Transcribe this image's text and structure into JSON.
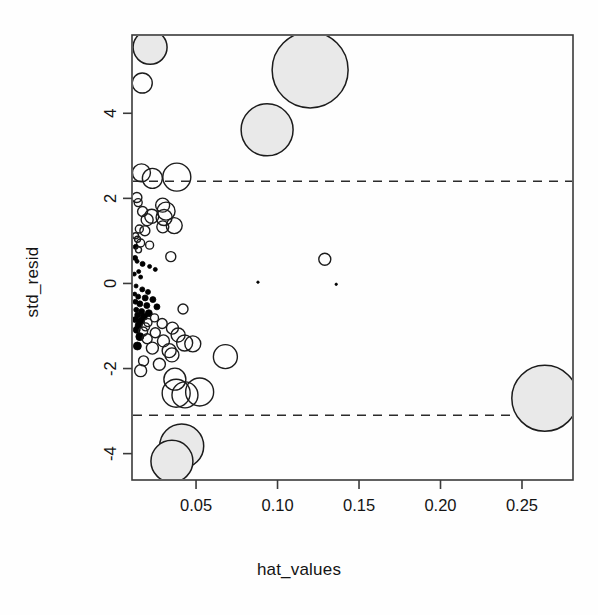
{
  "chart_data": {
    "type": "scatter",
    "title": "",
    "subtitle": "",
    "xlabel": "hat_values",
    "ylabel": "std_resid",
    "xlim": [
      0.0107,
      0.2813
    ],
    "ylim": [
      -4.62,
      5.84
    ],
    "grid": false,
    "legend": "none",
    "xticks": [
      0.05,
      0.1,
      0.15,
      0.2,
      0.25
    ],
    "xtick_labels": [
      "0.05",
      "0.10",
      "0.15",
      "0.20",
      "0.25"
    ],
    "yticks": [
      4,
      2,
      0,
      -2,
      -4
    ],
    "ytick_labels": [
      "4",
      "2",
      "0",
      "-2",
      "-4"
    ],
    "reference_lines": [
      {
        "name": "upper-threshold",
        "axis": "y",
        "value": 2.4,
        "style": "dashed"
      },
      {
        "name": "lower-threshold",
        "axis": "y",
        "value": -3.1,
        "style": "dashed"
      }
    ],
    "marker_style": {
      "shape": "circle",
      "size_encodes": "cooks_distance",
      "small_fill": "#000000",
      "outline": "#1c1c1c",
      "large_fill": "#e9e9e9"
    },
    "points": [
      {
        "x": 0.0218,
        "y": 5.55,
        "r": 17,
        "filled": true
      },
      {
        "x": 0.017,
        "y": 4.71,
        "r": 10,
        "filled": false
      },
      {
        "x": 0.12,
        "y": 5.02,
        "r": 38,
        "filled": true
      },
      {
        "x": 0.0936,
        "y": 3.61,
        "r": 26,
        "filled": true
      },
      {
        "x": 0.0165,
        "y": 2.6,
        "r": 9,
        "filled": false
      },
      {
        "x": 0.0232,
        "y": 2.47,
        "r": 10,
        "filled": false
      },
      {
        "x": 0.0382,
        "y": 2.5,
        "r": 14,
        "filled": false
      },
      {
        "x": 0.0137,
        "y": 2.02,
        "r": 5,
        "filled": false
      },
      {
        "x": 0.0145,
        "y": 1.9,
        "r": 4,
        "filled": false
      },
      {
        "x": 0.0295,
        "y": 1.84,
        "r": 7,
        "filled": false
      },
      {
        "x": 0.0316,
        "y": 1.7,
        "r": 9,
        "filled": false
      },
      {
        "x": 0.0172,
        "y": 1.69,
        "r": 5,
        "filled": false
      },
      {
        "x": 0.0228,
        "y": 1.58,
        "r": 7,
        "filled": false
      },
      {
        "x": 0.0304,
        "y": 1.55,
        "r": 8,
        "filled": false
      },
      {
        "x": 0.02,
        "y": 1.5,
        "r": 6,
        "filled": false
      },
      {
        "x": 0.0366,
        "y": 1.36,
        "r": 8,
        "filled": false
      },
      {
        "x": 0.0296,
        "y": 1.33,
        "r": 6,
        "filled": false
      },
      {
        "x": 0.0152,
        "y": 1.28,
        "r": 4,
        "filled": false
      },
      {
        "x": 0.0186,
        "y": 1.24,
        "r": 5,
        "filled": false
      },
      {
        "x": 0.0129,
        "y": 1.12,
        "r": 3,
        "filled": false
      },
      {
        "x": 0.0141,
        "y": 1.04,
        "r": 3,
        "filled": false
      },
      {
        "x": 0.016,
        "y": 0.95,
        "r": 4,
        "filled": false
      },
      {
        "x": 0.0215,
        "y": 0.9,
        "r": 4,
        "filled": false
      },
      {
        "x": 0.013,
        "y": 0.86,
        "r": 2.5,
        "filled": true
      },
      {
        "x": 0.0147,
        "y": 0.79,
        "r": 3,
        "filled": false
      },
      {
        "x": 0.0345,
        "y": 0.63,
        "r": 5,
        "filled": false
      },
      {
        "x": 0.129,
        "y": 0.57,
        "r": 6,
        "filled": false
      },
      {
        "x": 0.0126,
        "y": 0.6,
        "r": 2.5,
        "filled": true
      },
      {
        "x": 0.0138,
        "y": 0.52,
        "r": 2,
        "filled": true
      },
      {
        "x": 0.0172,
        "y": 0.46,
        "r": 2.5,
        "filled": true
      },
      {
        "x": 0.0215,
        "y": 0.4,
        "r": 2,
        "filled": true
      },
      {
        "x": 0.025,
        "y": 0.33,
        "r": 2,
        "filled": true
      },
      {
        "x": 0.0148,
        "y": 0.28,
        "r": 2,
        "filled": true
      },
      {
        "x": 0.0121,
        "y": 0.22,
        "r": 2,
        "filled": true
      },
      {
        "x": 0.016,
        "y": 0.15,
        "r": 2,
        "filled": true
      },
      {
        "x": 0.088,
        "y": 0.03,
        "r": 1.2,
        "filled": true
      },
      {
        "x": 0.136,
        "y": -0.02,
        "r": 1.2,
        "filled": true
      },
      {
        "x": 0.0132,
        "y": -0.06,
        "r": 2,
        "filled": true
      },
      {
        "x": 0.017,
        "y": -0.14,
        "r": 2.5,
        "filled": true
      },
      {
        "x": 0.0205,
        "y": -0.2,
        "r": 2.5,
        "filled": true
      },
      {
        "x": 0.0124,
        "y": -0.25,
        "r": 2,
        "filled": true
      },
      {
        "x": 0.0145,
        "y": -0.31,
        "r": 2.5,
        "filled": true
      },
      {
        "x": 0.0188,
        "y": -0.34,
        "r": 3,
        "filled": true
      },
      {
        "x": 0.0235,
        "y": -0.38,
        "r": 3,
        "filled": true
      },
      {
        "x": 0.0128,
        "y": -0.43,
        "r": 2.5,
        "filled": true
      },
      {
        "x": 0.0155,
        "y": -0.48,
        "r": 3,
        "filled": true
      },
      {
        "x": 0.0198,
        "y": -0.52,
        "r": 3,
        "filled": true
      },
      {
        "x": 0.026,
        "y": -0.55,
        "r": 3,
        "filled": true
      },
      {
        "x": 0.042,
        "y": -0.6,
        "r": 5,
        "filled": false
      },
      {
        "x": 0.0133,
        "y": -0.62,
        "r": 2.5,
        "filled": true
      },
      {
        "x": 0.0166,
        "y": -0.66,
        "r": 3,
        "filled": true
      },
      {
        "x": 0.021,
        "y": -0.7,
        "r": 3.5,
        "filled": true
      },
      {
        "x": 0.0142,
        "y": -0.74,
        "r": 3,
        "filled": true
      },
      {
        "x": 0.018,
        "y": -0.78,
        "r": 3.5,
        "filled": true
      },
      {
        "x": 0.0245,
        "y": -0.81,
        "r": 4,
        "filled": false
      },
      {
        "x": 0.0128,
        "y": -0.85,
        "r": 3,
        "filled": true
      },
      {
        "x": 0.0162,
        "y": -0.88,
        "r": 3.5,
        "filled": true
      },
      {
        "x": 0.0205,
        "y": -0.92,
        "r": 4,
        "filled": false
      },
      {
        "x": 0.0292,
        "y": -0.94,
        "r": 5,
        "filled": false
      },
      {
        "x": 0.0148,
        "y": -0.98,
        "r": 3.5,
        "filled": true
      },
      {
        "x": 0.019,
        "y": -1.02,
        "r": 4,
        "filled": false
      },
      {
        "x": 0.0355,
        "y": -1.05,
        "r": 6,
        "filled": false
      },
      {
        "x": 0.0136,
        "y": -1.09,
        "r": 3.5,
        "filled": true
      },
      {
        "x": 0.0175,
        "y": -1.13,
        "r": 4.5,
        "filled": false
      },
      {
        "x": 0.025,
        "y": -1.16,
        "r": 5,
        "filled": false
      },
      {
        "x": 0.039,
        "y": -1.21,
        "r": 7,
        "filled": false
      },
      {
        "x": 0.0155,
        "y": -1.25,
        "r": 4,
        "filled": true
      },
      {
        "x": 0.02,
        "y": -1.3,
        "r": 5,
        "filled": false
      },
      {
        "x": 0.03,
        "y": -1.35,
        "r": 6,
        "filled": false
      },
      {
        "x": 0.043,
        "y": -1.4,
        "r": 8,
        "filled": false
      },
      {
        "x": 0.048,
        "y": -1.42,
        "r": 8,
        "filled": false
      },
      {
        "x": 0.014,
        "y": -1.47,
        "r": 4,
        "filled": true
      },
      {
        "x": 0.0232,
        "y": -1.52,
        "r": 6,
        "filled": false
      },
      {
        "x": 0.0335,
        "y": -1.58,
        "r": 7,
        "filled": false
      },
      {
        "x": 0.0352,
        "y": -1.68,
        "r": 7,
        "filled": false
      },
      {
        "x": 0.068,
        "y": -1.72,
        "r": 12,
        "filled": false
      },
      {
        "x": 0.0178,
        "y": -1.82,
        "r": 5,
        "filled": false
      },
      {
        "x": 0.0275,
        "y": -1.9,
        "r": 6,
        "filled": false
      },
      {
        "x": 0.016,
        "y": -2.05,
        "r": 6,
        "filled": false
      },
      {
        "x": 0.037,
        "y": -2.25,
        "r": 11,
        "filled": false
      },
      {
        "x": 0.0378,
        "y": -2.58,
        "r": 14,
        "filled": false
      },
      {
        "x": 0.0432,
        "y": -2.62,
        "r": 13,
        "filled": false
      },
      {
        "x": 0.0522,
        "y": -2.55,
        "r": 14,
        "filled": false
      },
      {
        "x": 0.264,
        "y": -2.7,
        "r": 33,
        "filled": true
      },
      {
        "x": 0.0412,
        "y": -3.82,
        "r": 22,
        "filled": true
      },
      {
        "x": 0.0352,
        "y": -4.18,
        "r": 21,
        "filled": true
      }
    ]
  },
  "axes": {
    "x_axis_name": "hat_values",
    "y_axis_name": "std_resid"
  }
}
